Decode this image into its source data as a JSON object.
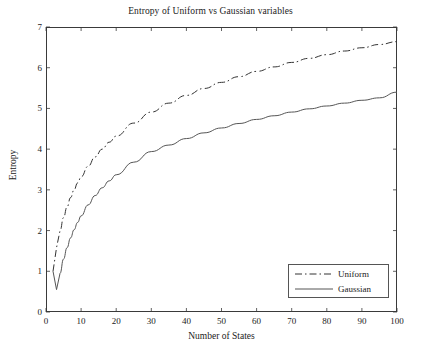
{
  "chart_data": {
    "type": "line",
    "title": "Entropy of Uniform vs Gaussian variables",
    "xlabel": "Number of States",
    "ylabel": "Entropy",
    "xlim": [
      0,
      100
    ],
    "ylim": [
      0,
      7
    ],
    "xticks": [
      0,
      10,
      20,
      30,
      40,
      50,
      60,
      70,
      80,
      90,
      100
    ],
    "yticks": [
      0,
      1,
      2,
      3,
      4,
      5,
      6,
      7
    ],
    "grid": false,
    "legend_position": "lower right",
    "series": [
      {
        "name": "Uniform",
        "style": "dash-dot",
        "color": "#333333",
        "x": [
          2,
          3,
          4,
          5,
          6,
          7,
          8,
          9,
          10,
          12,
          14,
          16,
          18,
          20,
          25,
          30,
          35,
          40,
          45,
          50,
          55,
          60,
          65,
          70,
          75,
          80,
          85,
          90,
          95,
          100
        ],
        "values": [
          1.0,
          1.58,
          2.0,
          2.32,
          2.58,
          2.81,
          3.0,
          3.17,
          3.32,
          3.58,
          3.81,
          4.0,
          4.17,
          4.32,
          4.64,
          4.91,
          5.13,
          5.32,
          5.49,
          5.64,
          5.78,
          5.91,
          6.02,
          6.13,
          6.23,
          6.32,
          6.41,
          6.49,
          6.57,
          6.64
        ]
      },
      {
        "name": "Gaussian",
        "style": "solid",
        "color": "#555555",
        "x": [
          2,
          3,
          4,
          5,
          6,
          7,
          8,
          9,
          10,
          12,
          14,
          16,
          18,
          20,
          25,
          30,
          35,
          40,
          45,
          50,
          55,
          60,
          65,
          70,
          75,
          80,
          85,
          90,
          95,
          100
        ],
        "values": [
          1.0,
          0.55,
          0.95,
          1.3,
          1.58,
          1.82,
          2.02,
          2.2,
          2.36,
          2.63,
          2.86,
          3.05,
          3.22,
          3.37,
          3.68,
          3.94,
          4.1,
          4.26,
          4.4,
          4.52,
          4.63,
          4.73,
          4.82,
          4.91,
          4.99,
          5.06,
          5.13,
          5.2,
          5.26,
          5.4
        ]
      }
    ]
  },
  "legend": {
    "items": [
      {
        "label": "Uniform",
        "style": "dash-dot"
      },
      {
        "label": "Gaussian",
        "style": "solid"
      }
    ]
  }
}
